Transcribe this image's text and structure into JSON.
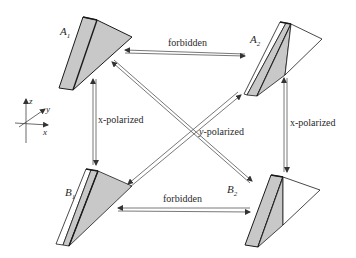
{
  "diagram": {
    "prisms": [
      {
        "id": "A1",
        "label": "A",
        "sub": "1"
      },
      {
        "id": "A2",
        "label": "A",
        "sub": "2"
      },
      {
        "id": "B1",
        "label": "B",
        "sub": "1"
      },
      {
        "id": "B2",
        "label": "B",
        "sub": "2"
      }
    ],
    "transitions": {
      "top": "forbidden",
      "bottom": "forbidden",
      "left": "x-polarized",
      "right": "x-polarized",
      "diagonal": "y-polarized"
    },
    "axes": {
      "z": "z",
      "y": "y",
      "x": "x"
    },
    "colors": {
      "shade": "#c8c8c8",
      "stroke": "#1a1a1a",
      "arrow": "#555555"
    }
  }
}
